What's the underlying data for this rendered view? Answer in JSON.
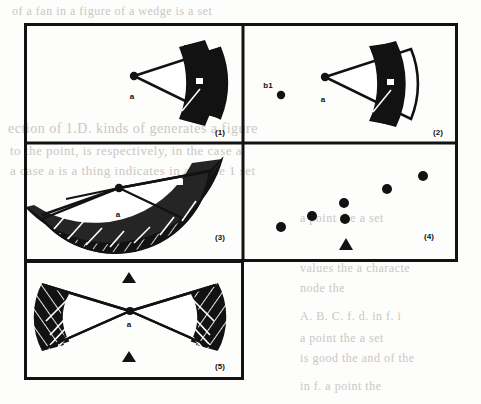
{
  "figure": {
    "caption_labels": [
      "(1)",
      "(2)",
      "(3)",
      "(4)",
      "(5)"
    ],
    "ink_color": "#121212",
    "paper_color": "#fdfdfc",
    "ghost_color": "#c9c7c3",
    "frame": {
      "x": 24,
      "y": 23,
      "width": 434,
      "height": 357,
      "border_px": 3
    },
    "panels": [
      {
        "id": "panel-1",
        "label": "(1)",
        "label_pos": {
          "x": 196,
          "y": 112
        },
        "rect": {
          "x": 0,
          "y": 0,
          "width": 219,
          "height": 120
        },
        "point_labels": [
          {
            "text": "a",
            "x": 112,
            "y": 73
          }
        ],
        "markers": [
          {
            "shape": "dot",
            "x": 110,
            "y": 53,
            "r": 4
          }
        ],
        "description": "filled annular sector (wedge) with apex at a, opening right"
      },
      {
        "id": "panel-2",
        "label": "(2)",
        "label_pos": {
          "x": 195,
          "y": 112
        },
        "rect": {
          "x": 219,
          "y": 0,
          "width": 215,
          "height": 120
        },
        "point_labels": [
          {
            "text": "a",
            "x": 84,
            "y": 76
          },
          {
            "text": "b1",
            "x": 22,
            "y": 62
          }
        ],
        "markers": [
          {
            "shape": "dot",
            "x": 82,
            "y": 54,
            "r": 4
          },
          {
            "shape": "dot",
            "x": 38,
            "y": 72,
            "r": 4
          }
        ],
        "description": "same wedge as panel 1 plus isolated point b1 to the left"
      },
      {
        "id": "panel-3",
        "label": "(3)",
        "label_pos": {
          "x": 196,
          "y": 97
        },
        "rect": {
          "x": 0,
          "y": 120,
          "width": 219,
          "height": 118
        },
        "point_labels": [
          {
            "text": "a",
            "x": 97,
            "y": 72
          }
        ],
        "markers": [
          {
            "shape": "dot",
            "x": 95,
            "y": 45,
            "r": 4
          }
        ],
        "description": "wide hatched annular sector spanning about 170 degrees, apex at a"
      },
      {
        "id": "panel-4",
        "label": "(4)",
        "label_pos": {
          "x": 186,
          "y": 96
        },
        "rect": {
          "x": 219,
          "y": 120,
          "width": 215,
          "height": 118
        },
        "markers": [
          {
            "shape": "dot",
            "x": 38,
            "y": 84,
            "r": 5
          },
          {
            "shape": "dot",
            "x": 69,
            "y": 73,
            "r": 5
          },
          {
            "shape": "dot",
            "x": 101,
            "y": 60,
            "r": 5
          },
          {
            "shape": "dot",
            "x": 102,
            "y": 76,
            "r": 5
          },
          {
            "shape": "dot",
            "x": 144,
            "y": 46,
            "r": 5
          },
          {
            "shape": "dot",
            "x": 180,
            "y": 33,
            "r": 5
          },
          {
            "shape": "triangle",
            "x": 103,
            "y": 102,
            "r": 6
          }
        ],
        "description": "scatter of six filled dots rising to the right plus one triangle marker below"
      },
      {
        "id": "panel-5",
        "label": "(5)",
        "label_pos": {
          "x": 196,
          "y": 108
        },
        "rect": {
          "x": 0,
          "y": 238,
          "width": 219,
          "height": 119
        },
        "point_labels": [
          {
            "text": "a",
            "x": 106,
            "y": 62
          }
        ],
        "markers": [
          {
            "shape": "triangle",
            "x": 105,
            "y": 17,
            "r": 6
          },
          {
            "shape": "triangle",
            "x": 105,
            "y": 97,
            "r": 6
          }
        ],
        "description": "bowtie: two opposing hatched wedges meeting at apex a, triangles above and below"
      }
    ]
  },
  "background_text": {
    "lines": [
      {
        "text": "of a  fan   in   a   figure   of   a   wedge   is   a   set",
        "x": 12,
        "y": 10,
        "size": 12
      },
      {
        "text": "space",
        "x": 360,
        "y": 72,
        "size": 13
      },
      {
        "text": "ection  of  1.D.  kinds  of     generates  a  figure",
        "x": 8,
        "y": 128,
        "size": 14
      },
      {
        "text": "to the  point,  is  respectively,   in  the  case  a",
        "x": 10,
        "y": 150,
        "size": 13
      },
      {
        "text": "a  case  a  is  a  thing  indicates  in  and  the  1  set",
        "x": 10,
        "y": 170,
        "size": 13
      },
      {
        "text": "a  point  the  a  set",
        "x": 300,
        "y": 218,
        "size": 12
      },
      {
        "text": "values  the  a   characte",
        "x": 300,
        "y": 268,
        "size": 12
      },
      {
        "text": "node   the",
        "x": 300,
        "y": 288,
        "size": 12
      },
      {
        "text": "A. B. C. f. d. in f. i",
        "x": 300,
        "y": 316,
        "size": 12
      },
      {
        "text": "a  point  the  a  set",
        "x": 300,
        "y": 338,
        "size": 12
      },
      {
        "text": "is  good   the  and  of  the",
        "x": 300,
        "y": 358,
        "size": 12
      },
      {
        "text": "in  f.    a  point   the",
        "x": 300,
        "y": 386,
        "size": 12
      }
    ]
  }
}
